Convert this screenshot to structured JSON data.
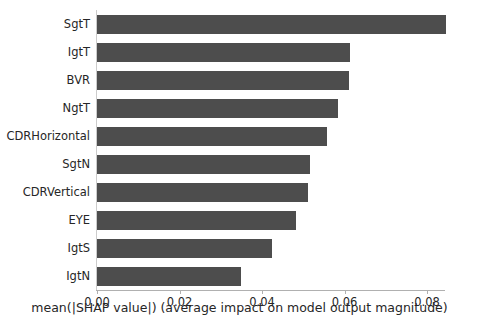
{
  "chart_data": {
    "type": "bar",
    "orientation": "horizontal",
    "title": "",
    "subtitle": "",
    "xlabel": "mean(|SHAP value|) (average impact on model output magnitude)",
    "ylabel": "",
    "categories": [
      "SgtT",
      "IgtT",
      "BVR",
      "NgtT",
      "CDRHorizontal",
      "SgtN",
      "CDRVertical",
      "EYE",
      "IgtS",
      "IgtN"
    ],
    "values": [
      0.0845,
      0.0613,
      0.0612,
      0.0584,
      0.0558,
      0.0516,
      0.0512,
      0.0483,
      0.0424,
      0.0349
    ],
    "xlim": [
      0.0,
      0.0905
    ],
    "xticks": [
      0.0,
      0.02,
      0.04,
      0.06,
      0.08
    ],
    "xtick_labels": [
      "0.00",
      "0.02",
      "0.04",
      "0.06",
      "0.08"
    ],
    "grid": false,
    "legend": null,
    "bar_color": "#4d4d4d",
    "background_color": "#ffffff",
    "axis_color": "#cccccc"
  }
}
